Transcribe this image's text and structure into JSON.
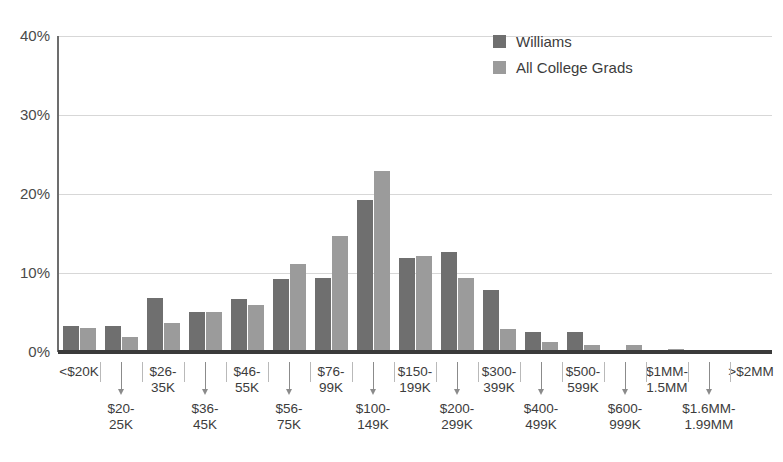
{
  "chart_data": {
    "type": "bar",
    "title": "",
    "xlabel": "",
    "ylabel": "",
    "ylim": [
      0,
      40
    ],
    "ytick_labels": [
      "40%",
      "30%",
      "20%",
      "10%",
      "0%"
    ],
    "ytick_values": [
      40,
      30,
      20,
      10,
      0
    ],
    "grid": true,
    "legend_position": "top-right",
    "categories": [
      "<$20K",
      "$20-25K",
      "$26-35K",
      "$36-45K",
      "$46-55K",
      "$56-75K",
      "$76-99K",
      "$100-149K",
      "$150-199K",
      "$200-299K",
      "$300-399K",
      "$400-499K",
      "$500-599K",
      "$600-999K",
      "$1MM-1.5MM",
      "$1.6MM-1.99MM",
      ">$2MM"
    ],
    "category_labels_display": [
      "<$20K",
      "$20-\n25K",
      "$26-\n35K",
      "$36-\n45K",
      "$46-\n55K",
      "$56-\n75K",
      "$76-\n99K",
      "$100-\n149K",
      "$150-\n199K",
      "$200-\n299K",
      "$300-\n399K",
      "$400-\n499K",
      "$500-\n599K",
      "$600-\n999K",
      "$1MM-\n1.5MM",
      "$1.6MM-\n1.99MM",
      ">$2MM"
    ],
    "series": [
      {
        "name": "Williams",
        "color": "#6f6f6f",
        "values": [
          3.3,
          3.3,
          6.8,
          5.1,
          6.7,
          9.3,
          9.4,
          19.3,
          11.9,
          12.6,
          7.8,
          2.5,
          2.5,
          0.2,
          0.2,
          0.1,
          0.2
        ]
      },
      {
        "name": "All College Grads",
        "color": "#9b9b9b",
        "values": [
          3.1,
          1.9,
          3.7,
          5.1,
          6.0,
          11.2,
          14.7,
          22.9,
          12.2,
          9.4,
          2.9,
          1.3,
          0.9,
          0.9,
          0.4,
          0.2,
          0.2
        ]
      }
    ]
  },
  "legend": {
    "items": [
      {
        "label": "Williams",
        "color": "#6f6f6f"
      },
      {
        "label": "All College Grads",
        "color": "#9b9b9b"
      }
    ]
  },
  "axes": {
    "y_labels": [
      "40%",
      "30%",
      "20%",
      "10%",
      "0%"
    ]
  },
  "colors": {
    "series_dark": "#6f6f6f",
    "series_light": "#9b9b9b",
    "gridline": "#d7d7d7",
    "axis": "#3a3a3a",
    "text": "#3c3c3c",
    "background": "#ffffff"
  }
}
